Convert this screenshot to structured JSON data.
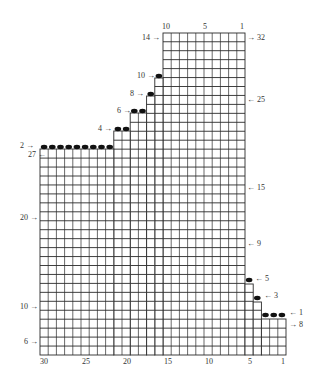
{
  "diagram": {
    "type": "knitting-chart",
    "grid": {
      "origin_x": 40,
      "col_width": 8.2,
      "total_columns": 30,
      "line_color": "#2a2a2a",
      "dot_color": "#111111"
    },
    "shape_blocks": [
      {
        "name": "top-block",
        "col_from": 15,
        "col_to": 6,
        "y_top": 33,
        "y_bottom": 355,
        "row_h": 8.95
      },
      {
        "name": "step-10",
        "col_from": 16,
        "col_to": 16,
        "y_top": 78,
        "y_bottom": 355,
        "row_h": 8.95
      },
      {
        "name": "step-8",
        "col_from": 17,
        "col_to": 17,
        "y_top": 96,
        "y_bottom": 355,
        "row_h": 8.95
      },
      {
        "name": "step-6",
        "col_from": 19,
        "col_to": 18,
        "y_top": 113,
        "y_bottom": 355,
        "row_h": 8.95
      },
      {
        "name": "step-4",
        "col_from": 21,
        "col_to": 20,
        "y_top": 131,
        "y_bottom": 355,
        "row_h": 8.95
      },
      {
        "name": "step-2",
        "col_from": 30,
        "col_to": 22,
        "y_top": 149,
        "y_bottom": 355,
        "row_h": 8.95
      },
      {
        "name": "step-right-5",
        "col_from": 5,
        "col_to": 5,
        "y_top": 284,
        "y_bottom": 355,
        "row_h": 8.95
      },
      {
        "name": "step-right-3",
        "col_from": 4,
        "col_to": 4,
        "y_top": 302,
        "y_bottom": 355,
        "row_h": 8.95
      },
      {
        "name": "step-right-1",
        "col_from": 3,
        "col_to": 1,
        "y_top": 319,
        "y_bottom": 355,
        "row_h": 8.95
      }
    ],
    "bind_off_dots": [
      {
        "row_label": "10",
        "cols": [
          16
        ],
        "y": 76
      },
      {
        "row_label": "8",
        "cols": [
          17
        ],
        "y": 94
      },
      {
        "row_label": "6",
        "cols": [
          19,
          18
        ],
        "y": 111
      },
      {
        "row_label": "4",
        "cols": [
          21,
          20
        ],
        "y": 129
      },
      {
        "row_label": "2",
        "cols": [
          30,
          29,
          28,
          27,
          26,
          25,
          24,
          23,
          22
        ],
        "y": 147
      },
      {
        "row_label": "5",
        "cols": [
          5
        ],
        "y": 280
      },
      {
        "row_label": "3",
        "cols": [
          4
        ],
        "y": 298
      },
      {
        "row_label": "1",
        "cols": [
          3,
          2,
          1
        ],
        "y": 315
      }
    ],
    "top_axis": {
      "labels": [
        {
          "text": "10",
          "x": 166
        },
        {
          "text": "5",
          "x": 205
        },
        {
          "text": "1",
          "x": 242
        }
      ],
      "y": 23
    },
    "bottom_axis": {
      "labels": [
        {
          "text": "30",
          "x": 44
        },
        {
          "text": "25",
          "x": 86
        },
        {
          "text": "20",
          "x": 127
        },
        {
          "text": "15",
          "x": 168
        },
        {
          "text": "10",
          "x": 209
        },
        {
          "text": "5",
          "x": 250
        },
        {
          "text": "1",
          "x": 283
        }
      ],
      "y": 358
    },
    "row_labels_left": [
      {
        "text": "14 →",
        "x": 142,
        "y": 34
      },
      {
        "text": "10 →",
        "x": 137,
        "y": 72
      },
      {
        "text": "8 →",
        "x": 130,
        "y": 90
      },
      {
        "text": "6 →",
        "x": 117,
        "y": 107
      },
      {
        "text": "4 →",
        "x": 98,
        "y": 125
      },
      {
        "text": "2 →",
        "x": 20,
        "y": 142
      },
      {
        "text": "27 ←",
        "x": 28,
        "y": 151
      },
      {
        "text": "20 →",
        "x": 20,
        "y": 214
      },
      {
        "text": "10 →",
        "x": 20,
        "y": 303
      },
      {
        "text": "6 →",
        "x": 24,
        "y": 338
      }
    ],
    "row_labels_right": [
      {
        "text": "→ 32",
        "x": 247,
        "y": 34
      },
      {
        "text": "← 25",
        "x": 247,
        "y": 96
      },
      {
        "text": "← 15",
        "x": 247,
        "y": 184
      },
      {
        "text": "← 9",
        "x": 247,
        "y": 240
      },
      {
        "text": "← 5",
        "x": 255,
        "y": 275
      },
      {
        "text": "← 3",
        "x": 264,
        "y": 292
      },
      {
        "text": "← 1",
        "x": 289,
        "y": 309
      },
      {
        "text": "→ 8",
        "x": 289,
        "y": 321
      }
    ]
  }
}
